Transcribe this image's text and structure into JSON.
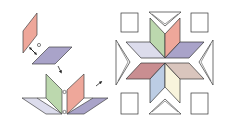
{
  "figure": {
    "colors": {
      "pink": "#eea79a",
      "purple": "#a9a3c9",
      "green": "#bcd8ae",
      "lavender": "#dcdcec",
      "rose": "#c98e91",
      "blue": "#bccde4",
      "cream": "#f8f4dc",
      "taupe": "#d9c5bd",
      "outline": "#333333",
      "background": "#ffffff"
    },
    "step1": {
      "pieces": [
        "pink-diamond-vertical",
        "purple-diamond-flat"
      ],
      "marker": "seam-dot",
      "arrow": "join-arrow"
    },
    "step2": {
      "pieces": [
        "lavender-diamond",
        "green-diamond",
        "pink-diamond",
        "purple-diamond"
      ],
      "markers": [
        "seam-dot-top",
        "seam-dot-bottom"
      ]
    },
    "step3": {
      "block": "eight-pointed-star",
      "diamonds": [
        "green",
        "pink",
        "lavender",
        "purple",
        "rose",
        "blue",
        "cream",
        "taupe"
      ],
      "corner_squares": 4,
      "side_triangles": 4
    }
  }
}
